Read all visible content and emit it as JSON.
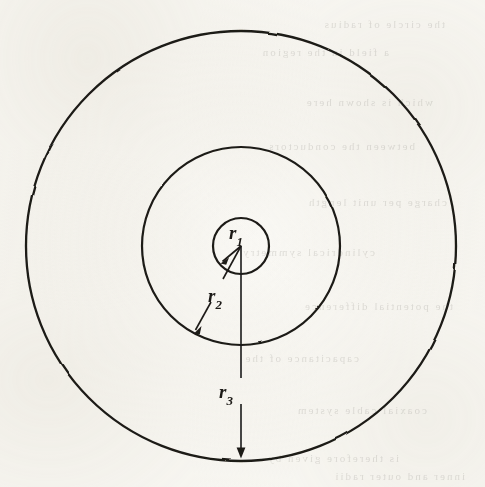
{
  "figure": {
    "name": "concentric-circles-radii-diagram",
    "background_color": "#faf9f5",
    "ink_color": "#1c1a17",
    "center": {
      "x": 241,
      "y": 246
    },
    "circles": [
      {
        "id": "inner",
        "label_ref": "r1",
        "radius": 28
      },
      {
        "id": "middle",
        "label_ref": "r2",
        "radius": 99
      },
      {
        "id": "outer",
        "label_ref": "r3",
        "radius": 215
      }
    ],
    "labels": [
      {
        "id": "r1",
        "base": "r",
        "subscript": "1",
        "x": 229,
        "y": 222
      },
      {
        "id": "r2",
        "base": "r",
        "subscript": "2",
        "x": 208,
        "y": 285
      },
      {
        "id": "r3",
        "base": "r",
        "subscript": "3",
        "x": 219,
        "y": 381
      }
    ],
    "leaders": [
      {
        "id": "r1",
        "from": {
          "x": 241,
          "y": 246
        },
        "to": {
          "x": 221,
          "y": 263
        },
        "arrow": "to"
      },
      {
        "id": "r2",
        "from": {
          "x": 241,
          "y": 246
        },
        "to": {
          "x": 194,
          "y": 333
        },
        "arrow": "to"
      },
      {
        "id": "r3",
        "from": {
          "x": 241,
          "y": 246
        },
        "to": {
          "x": 241,
          "y": 458
        },
        "arrow": "to"
      }
    ],
    "bleed_through_text": [
      {
        "text": "the  circle  of  radius",
        "x": 40,
        "y": 18
      },
      {
        "text": "a  field  in  the  region",
        "x": 96,
        "y": 46
      },
      {
        "text": "which  is  shown  here",
        "x": 52,
        "y": 96
      },
      {
        "text": "between  the  conductors",
        "x": 70,
        "y": 140
      },
      {
        "text": "charge  per  unit  length",
        "x": 38,
        "y": 196
      },
      {
        "text": "cylindrical  symmetry",
        "x": 110,
        "y": 246
      },
      {
        "text": "the  potential  difference",
        "x": 32,
        "y": 300
      },
      {
        "text": "capacitance  of  the",
        "x": 126,
        "y": 352
      },
      {
        "text": "coaxial  cable  system",
        "x": 58,
        "y": 404
      },
      {
        "text": "is  therefore  given  by",
        "x": 86,
        "y": 452
      },
      {
        "text": "inner  and  outer  radii",
        "x": 20,
        "y": 470
      }
    ]
  }
}
